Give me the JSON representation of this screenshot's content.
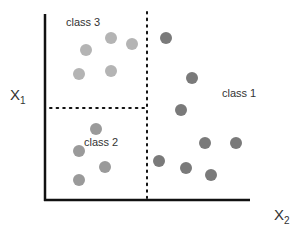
{
  "diagram": {
    "title": "",
    "axes": {
      "x_label": "X",
      "x_sub": "2",
      "y_label": "X",
      "y_sub": "1"
    },
    "classes": [
      {
        "name": "class 3",
        "color": "#b4b4b4",
        "label_pos": [
          66,
          17
        ]
      },
      {
        "name": "class 2",
        "color": "#9a9a9a",
        "label_pos": [
          84,
          136
        ]
      },
      {
        "name": "class 1",
        "color": "#7a7a7a",
        "label_pos": [
          222,
          88
        ]
      }
    ],
    "points": {
      "class 3": [
        [
          86,
          50
        ],
        [
          111,
          38
        ],
        [
          132,
          44
        ],
        [
          79,
          74
        ],
        [
          111,
          71
        ]
      ],
      "class 2": [
        [
          96,
          129
        ],
        [
          79,
          151
        ],
        [
          105,
          167
        ],
        [
          79,
          180
        ]
      ],
      "class 1": [
        [
          166,
          38
        ],
        [
          192,
          78
        ],
        [
          181,
          110
        ],
        [
          205,
          143
        ],
        [
          236,
          143
        ],
        [
          159,
          161
        ],
        [
          186,
          168
        ],
        [
          211,
          175
        ]
      ]
    },
    "boundaries": [
      {
        "type": "vertical",
        "x": 147,
        "y1": 12,
        "y2": 198,
        "style": "dotted"
      },
      {
        "type": "horizontal",
        "y": 108,
        "x1": 50,
        "x2": 147,
        "style": "dotted"
      }
    ]
  }
}
